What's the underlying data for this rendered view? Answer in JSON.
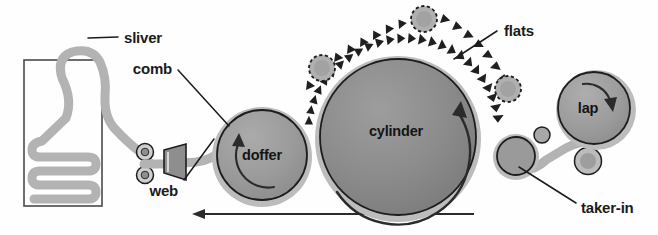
{
  "diagram": {
    "background_color": "#fefefe",
    "ink_color": "#1b1b1b",
    "palette": {
      "cylinder_fill": "#8a8a8a",
      "doffer_fill": "#9a9a9a",
      "lap_fill": "#9a9a9a",
      "takerin_fill": "#9a9a9a",
      "halo_gray": "#bcbcbc",
      "web_gray": "#b3b3b3",
      "outline": "#1d1d1d"
    }
  },
  "labels": {
    "sliver": "sliver",
    "comb": "comb",
    "web": "web",
    "doffer": "doffer",
    "cylinder": "cylinder",
    "flats": "flats",
    "lap": "lap",
    "taker_in": "taker-in"
  },
  "parts": [
    {
      "name": "sliver-can",
      "label": "",
      "shape": "rectangle",
      "cx": 63,
      "cy": 133,
      "w": 78,
      "h": 146
    },
    {
      "name": "doffer",
      "label": "doffer",
      "shape": "circle",
      "cx": 262,
      "cy": 155,
      "r": 46,
      "rotation": "counterclockwise"
    },
    {
      "name": "cylinder",
      "label": "cylinder",
      "shape": "circle",
      "cx": 398,
      "cy": 137,
      "r": 78,
      "rotation": "clockwise"
    },
    {
      "name": "lap",
      "label": "lap",
      "shape": "circle",
      "cx": 594,
      "cy": 108,
      "r": 36,
      "rotation": "clockwise"
    },
    {
      "name": "taker-in",
      "label": "taker-in",
      "shape": "circle",
      "cx": 516,
      "cy": 156,
      "r": 19,
      "rotation": ""
    },
    {
      "name": "comb",
      "label": "comb",
      "shape": "trapezoid",
      "cx": 174,
      "cy": 160,
      "w": 22,
      "h": 26
    }
  ],
  "flats": {
    "label": "flats",
    "tooth_count_arc": 26,
    "tooth_count_chain": 18,
    "pulleys": [
      {
        "name": "flats-pulley-left",
        "cx": 322,
        "cy": 68,
        "r": 13
      },
      {
        "name": "flats-pulley-top",
        "cx": 424,
        "cy": 19,
        "r": 13
      },
      {
        "name": "flats-pulley-right",
        "cx": 508,
        "cy": 89,
        "r": 13
      }
    ]
  },
  "feed_rollers": [
    {
      "name": "feed-roller-upper",
      "cx": 145,
      "cy": 152,
      "r": 8
    },
    {
      "name": "feed-roller-lower",
      "cx": 145,
      "cy": 175,
      "r": 8
    }
  ],
  "small_rollers": [
    {
      "name": "small-roller-above-takerin",
      "cx": 542,
      "cy": 135,
      "r": 7.5
    },
    {
      "name": "small-roller-below-lap",
      "cx": 588,
      "cy": 161,
      "r": 13
    }
  ],
  "flow_arrow": {
    "name": "material-flow-arrow",
    "direction": "left",
    "from_x": 474,
    "to_x": 192,
    "y": 214
  },
  "leaders": [
    {
      "name": "leader-sliver",
      "from": [
        118,
        37
      ],
      "to": [
        88,
        40
      ]
    },
    {
      "name": "leader-comb",
      "from": [
        178,
        68
      ],
      "to": [
        228,
        122
      ]
    },
    {
      "name": "leader-web",
      "from": [
        183,
        182
      ],
      "to": [
        213,
        141
      ]
    },
    {
      "name": "leader-flats",
      "from": [
        497,
        31
      ],
      "to": [
        455,
        58
      ]
    },
    {
      "name": "leader-takerin",
      "from": [
        578,
        205
      ],
      "to": [
        518,
        166
      ]
    }
  ]
}
